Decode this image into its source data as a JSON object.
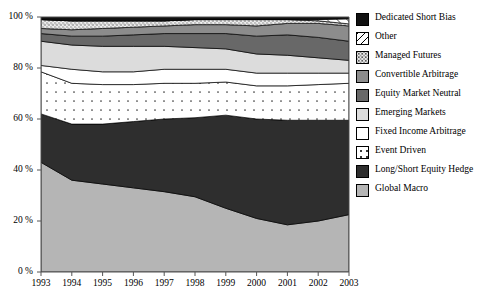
{
  "chart_data": {
    "type": "area",
    "stacked": true,
    "title": "",
    "xlabel": "",
    "ylabel": "",
    "ylim": [
      0,
      100
    ],
    "ytick_labels": [
      "0 %",
      "20 %",
      "40 %",
      "60 %",
      "80 %",
      "100 %"
    ],
    "ytick_values": [
      0,
      20,
      40,
      60,
      80,
      100
    ],
    "grid": false,
    "legend_position": "right",
    "categories": [
      "1993",
      "1994",
      "1995",
      "1996",
      "1997",
      "1998",
      "1999",
      "2000",
      "2001",
      "2002",
      "2003"
    ],
    "x": [
      1993,
      1994,
      1995,
      1996,
      1997,
      1998,
      1999,
      2000,
      2001,
      2002,
      2003
    ],
    "stack_order_bottom_to_top": [
      "Global Macro",
      "Long/Short Equity Hedge",
      "Event Driven",
      "Fixed Income Arbitrage",
      "Emerging Markets",
      "Equity Market Neutral",
      "Convertible Arbitrage",
      "Managed Futures",
      "Other",
      "Dedicated Short Bias"
    ],
    "series": [
      {
        "name": "Global Macro",
        "fill": "#b5b5b5",
        "pattern": "solid",
        "values": [
          43.0,
          36.0,
          34.5,
          33.0,
          31.5,
          29.5,
          25.0,
          21.0,
          18.5,
          20.0,
          22.5
        ]
      },
      {
        "name": "Long/Short Equity Hedge",
        "fill": "#2e2e2e",
        "pattern": "solid",
        "values": [
          19.0,
          22.0,
          23.5,
          26.0,
          28.5,
          31.0,
          36.5,
          39.0,
          41.0,
          39.5,
          37.0
        ]
      },
      {
        "name": "Event Driven",
        "fill": "#ffffff",
        "pattern": "dotted",
        "values": [
          16.5,
          16.0,
          15.5,
          14.5,
          14.0,
          13.5,
          13.0,
          13.0,
          13.5,
          14.0,
          14.5
        ]
      },
      {
        "name": "Fixed Income Arbitrage",
        "fill": "#ffffff",
        "pattern": "solid",
        "values": [
          2.5,
          5.5,
          5.0,
          5.0,
          5.5,
          5.5,
          5.0,
          5.0,
          5.0,
          4.5,
          4.0
        ]
      },
      {
        "name": "Emerging Markets",
        "fill": "#dcdcdc",
        "pattern": "solid",
        "values": [
          9.5,
          9.5,
          10.0,
          10.0,
          9.0,
          8.5,
          8.0,
          7.5,
          7.0,
          6.0,
          5.0
        ]
      },
      {
        "name": "Equity Market Neutral",
        "fill": "#686868",
        "pattern": "solid",
        "values": [
          3.0,
          3.5,
          4.0,
          4.5,
          5.0,
          5.5,
          6.0,
          7.0,
          8.0,
          8.0,
          7.5
        ]
      },
      {
        "name": "Convertible Arbitrage",
        "fill": "#8c8c8c",
        "pattern": "solid",
        "values": [
          2.0,
          2.5,
          3.0,
          3.0,
          3.0,
          3.5,
          3.5,
          4.0,
          4.5,
          5.5,
          6.0
        ]
      },
      {
        "name": "Managed Futures",
        "fill": "#eeeeee",
        "pattern": "stipple",
        "values": [
          3.5,
          3.5,
          3.0,
          2.5,
          2.0,
          2.0,
          2.0,
          2.5,
          1.5,
          1.0,
          0.8
        ]
      },
      {
        "name": "Other",
        "fill": "#ffffff",
        "pattern": "hatch",
        "values": [
          0.0,
          0.0,
          0.0,
          0.0,
          0.0,
          0.0,
          0.0,
          0.0,
          0.0,
          0.5,
          2.0
        ]
      },
      {
        "name": "Dedicated Short Bias",
        "fill": "#111111",
        "pattern": "solid",
        "values": [
          1.0,
          1.5,
          1.5,
          1.5,
          1.5,
          1.0,
          1.0,
          1.0,
          1.0,
          1.0,
          0.7
        ]
      }
    ],
    "legend_entries": [
      {
        "label": "Dedicated Short Bias",
        "swatch": "solid",
        "color": "#111111"
      },
      {
        "label": "Other",
        "swatch": "hatch",
        "color": "#ffffff"
      },
      {
        "label": "Managed Futures",
        "swatch": "stipple",
        "color": "#eeeeee"
      },
      {
        "label": "Convertible Arbitrage",
        "swatch": "solid",
        "color": "#8c8c8c"
      },
      {
        "label": "Equity Market Neutral",
        "swatch": "solid",
        "color": "#686868"
      },
      {
        "label": "Emerging Markets",
        "swatch": "solid",
        "color": "#dcdcdc"
      },
      {
        "label": "Fixed Income Arbitrage",
        "swatch": "solid",
        "color": "#ffffff"
      },
      {
        "label": "Event Driven",
        "swatch": "dotted",
        "color": "#ffffff"
      },
      {
        "label": "Long/Short Equity Hedge",
        "swatch": "solid",
        "color": "#2e2e2e"
      },
      {
        "label": "Global Macro",
        "swatch": "solid",
        "color": "#b5b5b5"
      }
    ]
  }
}
